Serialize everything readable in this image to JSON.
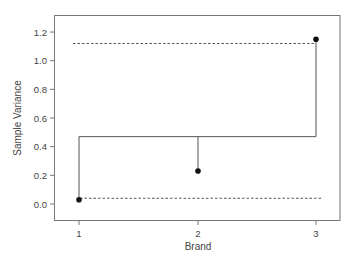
{
  "chart_data": {
    "type": "scatter",
    "title": "",
    "xlabel": "Brand",
    "ylabel": "Sample Variance",
    "categories": [
      "1",
      "2",
      "3"
    ],
    "x": [
      1,
      2,
      3
    ],
    "values": [
      0.03,
      0.23,
      1.15
    ],
    "center_line": 0.47,
    "upper_limit": 1.12,
    "lower_limit": 0.04,
    "xlim": [
      0.8,
      3.2
    ],
    "ylim": [
      -0.12,
      1.3
    ],
    "yticks": [
      0.0,
      0.2,
      0.4,
      0.6,
      0.8,
      1.0,
      1.2
    ],
    "ytick_labels": [
      "0.0",
      "0.2",
      "0.4",
      "0.6",
      "0.8",
      "1.0",
      "1.2"
    ],
    "xticks": [
      1,
      2,
      3
    ],
    "xtick_labels": [
      "1",
      "2",
      "3"
    ],
    "grid": false,
    "legend": null,
    "style": {
      "point_color": "#111111",
      "line_color": "#555555",
      "limit_line_style": "dashed"
    }
  }
}
